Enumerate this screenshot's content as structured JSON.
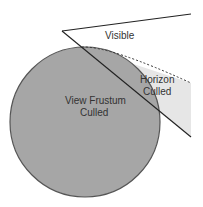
{
  "diagram": {
    "labels": {
      "visible": "Visible",
      "horizon_line1": "Horizon",
      "horizon_line2": "Culled",
      "frustum_line1": "View Frustum",
      "frustum_line2": "Culled"
    },
    "colors": {
      "background": "#ffffff",
      "globe_fill": "#a6a6a6",
      "globe_stroke": "#555555",
      "horizon_region": "#e6e6e6",
      "line": "#222222",
      "text": "#333333"
    }
  }
}
